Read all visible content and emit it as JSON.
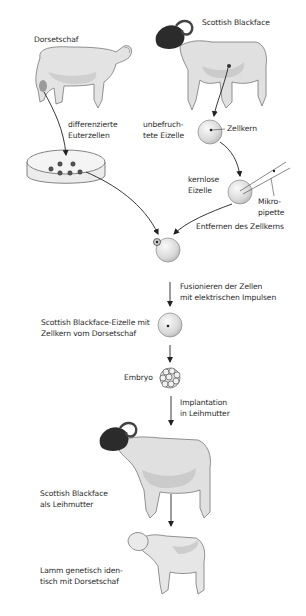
{
  "figure": {
    "background": "#ffffff",
    "text_color": "#2a2a2a",
    "arrow_color": "#222222",
    "sheep_wool_color": "#dcdcdc",
    "sheep_shadow_color": "#b8b8b8",
    "blackface_head_color": "#2b2b2b",
    "cell_fill_color": "#e2e2e2",
    "nucleus_color": "#222222"
  },
  "labels": {
    "dorset_sheep": "Dorsetschaf",
    "scottish_blackface": "Scottish Blackface",
    "udder_cells_line1": "differenzierte",
    "udder_cells_line2": "Euterzellen",
    "unfertilized_line1": "unbefruch-",
    "unfertilized_line2": "tete Eizelle",
    "nucleus": "Zellkern",
    "enucleated_line1": "kernlose",
    "enucleated_line2": "Eizelle",
    "micropipette_line1": "Mikro-",
    "micropipette_line2": "pipette",
    "remove_nucleus": "Entfernen des Zellkerns",
    "fusion_line1": "Fusionieren der Zellen",
    "fusion_line2": "mit elektrischen Impulsen",
    "hybrid_cell_line1": "Scottish Blackface-Eizelle mit",
    "hybrid_cell_line2": "Zellkern vom Dorsetschaf",
    "embryo": "Embryo",
    "implant_line1": "Implantation",
    "implant_line2": "in Leihmutter",
    "surrogate_line1": "Scottish Blackface",
    "surrogate_line2": "als Leihmutter",
    "lamb_line1": "Lamm genetisch iden-",
    "lamb_line2": "tisch mit Dorsetschaf"
  },
  "steps": [
    {
      "step": 1,
      "label": "Dorsetschaf",
      "icon": "dorset-sheep-icon"
    },
    {
      "step": 2,
      "label": "differenzierte Euterzellen",
      "icon": "petri-dish-icon"
    },
    {
      "step": 3,
      "label": "Scottish Blackface",
      "icon": "blackface-sheep-icon"
    },
    {
      "step": 4,
      "label": "unbefruchtete Eizelle",
      "icon": "egg-cell-icon"
    },
    {
      "step": 5,
      "label": "kernlose Eizelle",
      "icon": "enucleated-cell-icon"
    },
    {
      "step": 6,
      "label": "Fusionieren der Zellen mit elektrischen Impulsen",
      "icon": "fused-cells-icon"
    },
    {
      "step": 7,
      "label": "Scottish Blackface-Eizelle mit Zellkern vom Dorsetschaf",
      "icon": "hybrid-cell-icon"
    },
    {
      "step": 8,
      "label": "Embryo",
      "icon": "embryo-icon"
    },
    {
      "step": 9,
      "label": "Scottish Blackface als Leihmutter",
      "icon": "surrogate-sheep-icon"
    },
    {
      "step": 10,
      "label": "Lamm genetisch identisch mit Dorsetschaf",
      "icon": "lamb-icon"
    }
  ]
}
